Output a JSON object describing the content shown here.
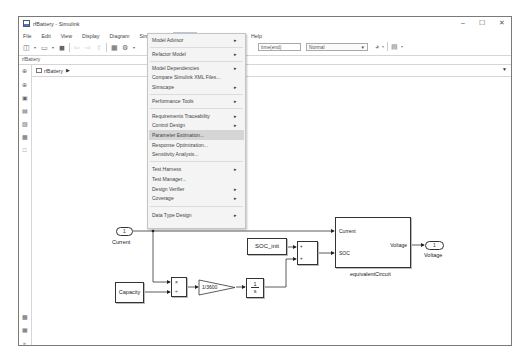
{
  "window": {
    "title": "rfBattery - Simulink",
    "controls": {
      "minimize": "–",
      "maximize": "☐",
      "close": "✕"
    }
  },
  "menubar": {
    "items": [
      "File",
      "Edit",
      "View",
      "Display",
      "Diagram",
      "Simulation",
      "Analysis",
      "Code",
      "Tools",
      "Help"
    ],
    "active": "Analysis"
  },
  "toolbar": {
    "stop_time": "time(end)",
    "sim_mode": "Normal",
    "icons": [
      "new-model-icon",
      "open-icon",
      "save-icon",
      "back-icon",
      "forward-icon",
      "up-icon",
      "library-browser-icon",
      "settings-icon",
      "run-icon",
      "record-icon"
    ]
  },
  "path_label": "rfBattery",
  "breadcrumb": {
    "model": "rfBattery"
  },
  "analysis_menu": {
    "items": [
      {
        "label": "Model Advisor",
        "submenu": true
      },
      {
        "label": "Refactor Model",
        "submenu": true
      },
      {
        "label": "Model Dependencies",
        "submenu": true
      },
      {
        "label": "Compare Simulink XML Files...",
        "submenu": false
      },
      {
        "label": "Simscape",
        "submenu": true
      },
      {
        "label": "Performance Tools",
        "submenu": true
      },
      {
        "label": "Requirements Traceability",
        "submenu": true
      },
      {
        "label": "Control Design",
        "submenu": true
      },
      {
        "label": "Parameter Estimation...",
        "submenu": false,
        "highlighted": true
      },
      {
        "label": "Response Optimization...",
        "submenu": false
      },
      {
        "label": "Sensitivity Analysis...",
        "submenu": false
      },
      {
        "label": "Test Harness",
        "submenu": true
      },
      {
        "label": "Test Manager...",
        "submenu": false
      },
      {
        "label": "Design Verifier",
        "submenu": true
      },
      {
        "label": "Coverage",
        "submenu": true
      },
      {
        "label": "Data Type Design",
        "submenu": true
      }
    ]
  },
  "diagram": {
    "inport": {
      "number": "1",
      "label": "Current"
    },
    "outport": {
      "number": "1",
      "label": "Voltage"
    },
    "capacity": "Capacity",
    "product": {
      "in1": "×",
      "in2": "÷"
    },
    "gain": "1/3600",
    "integrator": {
      "num": "1",
      "den": "s"
    },
    "soc_init": "SOC_init",
    "sum": {
      "in1": "+",
      "in2": "+"
    },
    "subsystem": {
      "name": "equivalentCircuit",
      "in1": "Current",
      "in2": "SOC",
      "out1": "Voltage"
    }
  }
}
